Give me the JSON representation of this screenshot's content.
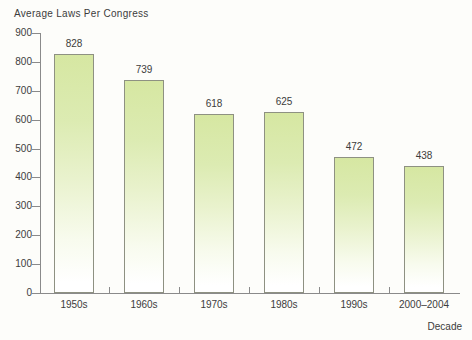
{
  "chart_data": {
    "type": "bar",
    "title": "Average Laws Per Congress",
    "categories": [
      "1950s",
      "1960s",
      "1970s",
      "1980s",
      "1990s",
      "2000–2004"
    ],
    "values": [
      828,
      739,
      618,
      625,
      472,
      438
    ],
    "xlabel": "Decade",
    "ylabel": "",
    "ylim": [
      0,
      900
    ],
    "ytick_step": 100,
    "ytick_labels": [
      "0",
      "100",
      "200",
      "300",
      "400",
      "500",
      "600",
      "700",
      "800",
      "900"
    ],
    "grid": false,
    "legend": "none",
    "value_labels_shown": true,
    "colors": {
      "bar_fill_top": "#d6e7a2",
      "bar_fill_bottom": "#ffffff",
      "bar_border": "#8e9182",
      "axis": "#8a8a8a",
      "text": "#3c3c3c",
      "background": "#fdfdfa"
    }
  }
}
